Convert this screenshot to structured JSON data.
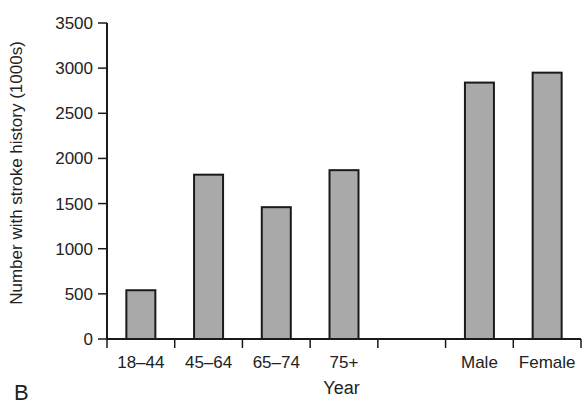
{
  "chart_data": {
    "type": "bar",
    "title": "",
    "panel_label": "B",
    "xlabel": "Year",
    "ylabel": "Number with stroke history (1000s)",
    "ylim": [
      0,
      3500
    ],
    "yticks": [
      0,
      500,
      1000,
      1500,
      2000,
      2500,
      3000,
      3500
    ],
    "categories": [
      "18–44",
      "45–64",
      "65–74",
      "75+",
      "",
      "Male",
      "Female"
    ],
    "values": [
      540,
      1820,
      1460,
      1870,
      null,
      2840,
      2950
    ],
    "grid": false,
    "legend": null,
    "bar_color": "#a9a9a9",
    "bar_edge_color": "#1a1a1a"
  }
}
